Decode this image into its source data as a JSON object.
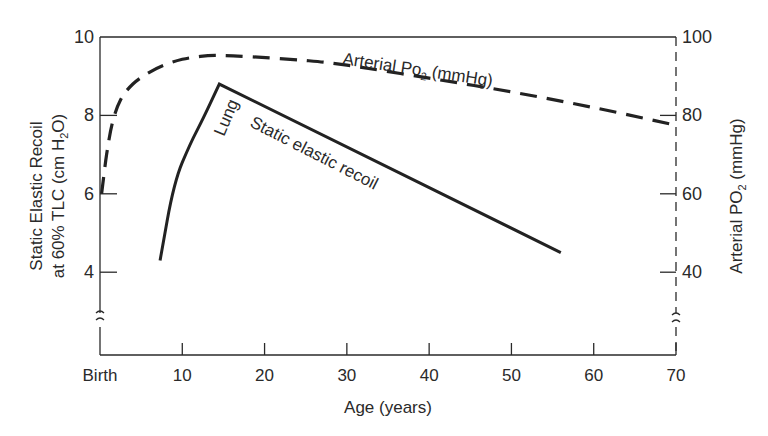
{
  "chart_data": {
    "type": "line",
    "title": "",
    "xlabel": "Age (years)",
    "ylabel": "Static Elastic Recoil at 60% TLC (cm H2O)",
    "ylabel_line1": "Static Elastic Recoil",
    "ylabel_line2_pre": "at 60% TLC (cm H",
    "ylabel_line2_sub": "2",
    "ylabel_line2_post": "O)",
    "y2label": "Arterial PO2 (mmHg)",
    "y2label_pre": "Arterial P",
    "y2label_o": "O",
    "y2label_sub": "2",
    "y2label_post": " (mmHg)",
    "xlim": [
      0,
      70
    ],
    "ylim": [
      2,
      10
    ],
    "y2lim": [
      20,
      100
    ],
    "x_ticks": [
      {
        "value": 0,
        "label": "Birth"
      },
      {
        "value": 10,
        "label": "10"
      },
      {
        "value": 20,
        "label": "20"
      },
      {
        "value": 30,
        "label": "30"
      },
      {
        "value": 40,
        "label": "40"
      },
      {
        "value": 50,
        "label": "50"
      },
      {
        "value": 60,
        "label": "60"
      },
      {
        "value": 70,
        "label": "70"
      }
    ],
    "y_ticks": [
      {
        "value": 4,
        "label": "4"
      },
      {
        "value": 6,
        "label": "6"
      },
      {
        "value": 8,
        "label": "8"
      },
      {
        "value": 10,
        "label": "10"
      }
    ],
    "y2_ticks": [
      {
        "value": 40,
        "label": "40"
      },
      {
        "value": 60,
        "label": "60"
      },
      {
        "value": 80,
        "label": "80"
      },
      {
        "value": 100,
        "label": "100"
      }
    ],
    "axis_break": true,
    "grid": false,
    "series": [
      {
        "name": "Lung static elastic recoil",
        "axis": "left",
        "style": "solid",
        "label_lung": "Lung",
        "label_main": "Static elastic recoil",
        "x": [
          7.3,
          9,
          11,
          12.5,
          14.5,
          56
        ],
        "y": [
          4.3,
          6.3,
          7.3,
          7.9,
          8.8,
          4.5
        ]
      },
      {
        "name": "Arterial PO2 (mmHg)",
        "axis": "right",
        "style": "dashed",
        "label_pre": "Arterial P",
        "label_o": "o",
        "label_sub": "2",
        "label_post": " (mmHg)",
        "x": [
          0.2,
          0.8,
          1.5,
          2.5,
          4,
          6,
          8,
          10,
          12,
          14,
          18,
          25,
          30,
          40,
          50,
          60,
          70
        ],
        "y": [
          60,
          70,
          78,
          84,
          88,
          91,
          93,
          94.3,
          95,
          95.3,
          95,
          94,
          92.8,
          89.5,
          86,
          82,
          77.5
        ]
      }
    ]
  }
}
